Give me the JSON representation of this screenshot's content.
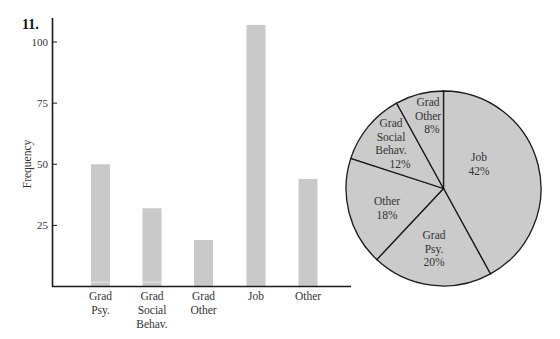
{
  "figure": {
    "number": "11.",
    "colors": {
      "bar": "#c9c9c9",
      "pie": "#cbcbcb",
      "axis": "#1a1a1a"
    }
  },
  "chart_data": [
    {
      "type": "bar",
      "title": "",
      "xlabel": "",
      "ylabel": "Frequency",
      "categories": [
        "Grad Psy.",
        "Grad Social Behav.",
        "Grad Other",
        "Job",
        "Other"
      ],
      "category_lines": [
        [
          "Grad",
          "Psy."
        ],
        [
          "Grad",
          "Social",
          "Behav."
        ],
        [
          "Grad",
          "Other"
        ],
        [
          "Job"
        ],
        [
          "Other"
        ]
      ],
      "values": [
        50,
        32,
        19,
        107,
        44
      ],
      "yticks": [
        25,
        50,
        75,
        100
      ],
      "ytick_labels": [
        "25",
        "50",
        "75",
        "100"
      ],
      "ylim": [
        0,
        110
      ],
      "grid": false,
      "legend": null
    },
    {
      "type": "pie",
      "title": "",
      "labels": [
        "Job",
        "Grad Psy.",
        "Other",
        "Grad Social Behav.",
        "Grad Other"
      ],
      "label_lines": [
        [
          "Job",
          "42%"
        ],
        [
          "Grad",
          "Psy.",
          "20%"
        ],
        [
          "Other",
          "18%"
        ],
        [
          "Grad",
          "Social",
          "Behav.",
          "12%"
        ],
        [
          "Grad",
          "Other",
          "8%"
        ]
      ],
      "values": [
        42,
        20,
        18,
        12,
        8
      ],
      "unit": "%",
      "start_angle": "12 o'clock",
      "direction": "clockwise",
      "legend": null
    }
  ]
}
